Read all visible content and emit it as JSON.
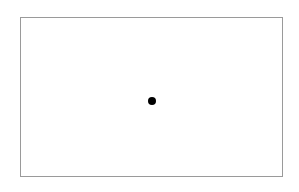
{
  "figure": {
    "canvas": {
      "width": 299,
      "height": 192,
      "background_color": "#ffffff"
    },
    "frame": {
      "name": "plot-frame",
      "left": 20,
      "top": 17,
      "width": 263,
      "height": 160,
      "border_color": "#9a9a9a",
      "border_width": 1,
      "fill_color": "#ffffff"
    }
  },
  "chart_data": {
    "type": "scatter",
    "title": "",
    "subtitle": "",
    "xlabel": "",
    "ylabel": "",
    "xlim": [
      0,
      1
    ],
    "ylim": [
      0,
      1
    ],
    "xticks": [],
    "yticks": [],
    "xticklabels": [],
    "yticklabels": [],
    "grid": false,
    "legend": null,
    "annotations": [],
    "series": [
      {
        "name": "point",
        "marker": "o",
        "marker_color": "#000000",
        "marker_size_px": 8,
        "x": [
          0.5
        ],
        "y": [
          0.48
        ],
        "points_px": [
          {
            "cx": 151.5,
            "cy": 100.5,
            "r": 4
          }
        ]
      }
    ]
  }
}
